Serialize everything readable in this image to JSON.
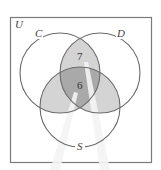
{
  "diagram": {
    "type": "venn",
    "universe": {
      "label": "U"
    },
    "sets": [
      {
        "id": "C",
        "label": "C"
      },
      {
        "id": "D",
        "label": "D"
      },
      {
        "id": "S",
        "label": "S"
      }
    ],
    "regions": [
      {
        "id": "C_and_D_only",
        "sets": [
          "C",
          "D"
        ],
        "value": "7",
        "shade": "light"
      },
      {
        "id": "C_and_D_and_S",
        "sets": [
          "C",
          "D",
          "S"
        ],
        "value": "6",
        "shade": "dark"
      },
      {
        "id": "C_and_S_only",
        "sets": [
          "C",
          "S"
        ],
        "value": "",
        "shade": "light"
      },
      {
        "id": "D_and_S_only",
        "sets": [
          "D",
          "S"
        ],
        "value": "",
        "shade": "light"
      }
    ],
    "colors": {
      "outline": "#6b6b6b",
      "light_shade": "#d4d4d4",
      "dark_shade": "#a9a9a9",
      "frame": "#7a7a7a",
      "ray": "#f2f2f2"
    }
  }
}
